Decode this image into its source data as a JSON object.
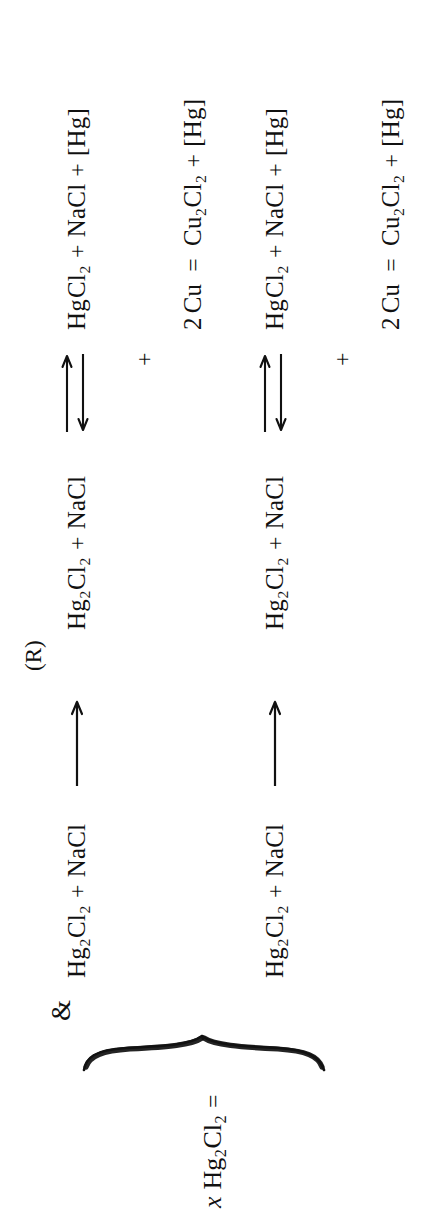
{
  "document": {
    "type": "scanned-chemistry-equation",
    "orientation_degrees": 270,
    "background_color": "#ffffff",
    "ink_color": "#111111"
  },
  "summary_line": {
    "coefficient": "x",
    "formula_main": "Hg",
    "formula_sub1": "2",
    "formula_mid": "Cl",
    "formula_sub2": "2",
    "equals": "="
  },
  "labels": {
    "reaction_label": "(R)",
    "ampersand": "&"
  },
  "reactions": [
    {
      "id": "reaction-1",
      "left": {
        "species": [
          {
            "base": "Hg",
            "sub": "2",
            "base2": "Cl",
            "sub2": "2"
          }
        ],
        "plus": "+",
        "second": "NaCl"
      },
      "arrow": "single-right",
      "middle": {
        "species": [
          {
            "base": "Hg",
            "sub": "2",
            "base2": "Cl",
            "sub2": "2"
          }
        ],
        "plus": "+",
        "second": "NaCl"
      },
      "arrow2": "reversible",
      "right": {
        "species": [
          {
            "base": "Hg",
            "sub": "",
            "base2": "Cl",
            "sub2": "2"
          }
        ],
        "plus1": "+",
        "second": "NaCl",
        "plus2": "+",
        "third": "[Hg]"
      },
      "below": {
        "plus": "+",
        "reagent_coeff": "2",
        "reagent": "Cu",
        "equals": "=",
        "product": {
          "base": "Cu",
          "sub": "2",
          "base2": "Cl",
          "sub2": "2"
        },
        "plus2": "+",
        "product2": "[Hg]"
      }
    },
    {
      "id": "reaction-2",
      "left": {
        "species": [
          {
            "base": "Hg",
            "sub": "2",
            "base2": "Cl",
            "sub2": "2"
          }
        ],
        "plus": "+",
        "second": "NaCl"
      },
      "arrow": "single-right",
      "middle": {
        "species": [
          {
            "base": "Hg",
            "sub": "2",
            "base2": "Cl",
            "sub2": "2"
          }
        ],
        "plus": "+",
        "second": "NaCl"
      },
      "arrow2": "reversible",
      "right": {
        "species": [
          {
            "base": "Hg",
            "sub": "",
            "base2": "Cl",
            "sub2": "2"
          }
        ],
        "plus1": "+",
        "second": "NaCl",
        "plus2": "+",
        "third": "[Hg]"
      },
      "below": {
        "plus": "+",
        "reagent_coeff": "2",
        "reagent": "Cu",
        "equals": "=",
        "product": {
          "base": "Cu",
          "sub": "2",
          "base2": "Cl",
          "sub2": "2"
        },
        "plus2": "+",
        "product2": "[Hg]"
      }
    }
  ]
}
